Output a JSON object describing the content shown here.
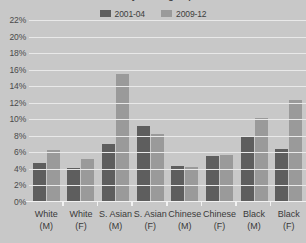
{
  "chart": {
    "title_clipped": "Prevalence by ethnic group and sex",
    "legend": [
      {
        "label": "2001-04",
        "color": "#5e5e5e"
      },
      {
        "label": "2009-12",
        "color": "#9a9a9a"
      }
    ],
    "y_ticks": [
      "0%",
      "2%",
      "4%",
      "6%",
      "8%",
      "10%",
      "12%",
      "14%",
      "16%",
      "18%",
      "20%",
      "22%"
    ],
    "categories_split": [
      {
        "line1": "White",
        "line2": "(M)"
      },
      {
        "line1": "White",
        "line2": "(F)"
      },
      {
        "line1": "S. Asian",
        "line2": "(M)"
      },
      {
        "line1": "S. Asian",
        "line2": "(F)"
      },
      {
        "line1": "Chinese",
        "line2": "(M)"
      },
      {
        "line1": "Chinese",
        "line2": "(F)"
      },
      {
        "line1": "Black",
        "line2": "(M)"
      },
      {
        "line1": "Black",
        "line2": "(F)"
      }
    ]
  },
  "chart_data": {
    "type": "bar",
    "title": "Prevalence by ethnic group and sex",
    "xlabel": "",
    "ylabel": "",
    "ylim": [
      0,
      22
    ],
    "ytick_step": 2,
    "grid": true,
    "legend_position": "top-center",
    "unit": "%",
    "categories": [
      "White (M)",
      "White (F)",
      "S. Asian (M)",
      "S. Asian (F)",
      "Chinese (M)",
      "Chinese (F)",
      "Black (M)",
      "Black (F)"
    ],
    "series": [
      {
        "name": "2001-04",
        "color": "#5e5e5e",
        "values": [
          4.5,
          3.9,
          6.8,
          9.0,
          4.2,
          5.4,
          7.8,
          6.2
        ]
      },
      {
        "name": "2009-12",
        "color": "#9a9a9a",
        "values": [
          6.1,
          5.0,
          15.3,
          8.1,
          4.1,
          5.5,
          10.0,
          12.2
        ]
      }
    ]
  }
}
